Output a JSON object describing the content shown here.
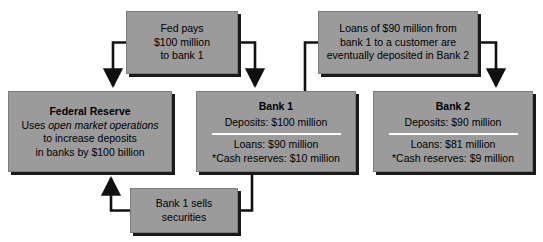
{
  "diagram": {
    "fill_color": "#9b9b9b",
    "shadow_color": "#1a1a1a",
    "rule_color": "#ffffff",
    "connector_color": "#101010",
    "nodes": {
      "fed_pays": {
        "lines": [
          "Fed pays",
          "$100 million",
          "to bank 1"
        ]
      },
      "loans_note": {
        "lines": [
          "Loans of $90 million from",
          "bank 1 to a customer are",
          "eventually deposited in Bank 2"
        ]
      },
      "federal_reserve": {
        "title": "Federal Reserve",
        "line1_prefix": "Uses ",
        "line1_italic": "open market operations",
        "line2": "to increase deposits",
        "line3": "in banks by $100 billion"
      },
      "bank_1": {
        "title": "Bank 1",
        "deposits": "Deposits: $100 million",
        "loans": "Loans: $90 million",
        "cash_reserves": "*Cash reserves: $10 million"
      },
      "bank_2": {
        "title": "Bank 2",
        "deposits": "Deposits: $90 million",
        "loans": "Loans: $81 million",
        "cash_reserves": "*Cash reserves: $9 million"
      },
      "sells_securities": {
        "lines": [
          "Bank 1 sells",
          "securities"
        ]
      }
    },
    "connectors": [
      {
        "name": "fed-pays-to-federal-reserve",
        "arrowhead": "down"
      },
      {
        "name": "fed-pays-to-bank-1",
        "arrowhead": "down"
      },
      {
        "name": "loans-note-to-bank-1",
        "arrowhead": "none"
      },
      {
        "name": "loans-note-to-bank-2",
        "arrowhead": "down"
      },
      {
        "name": "bank-1-to-sells-securities",
        "arrowhead": "none"
      },
      {
        "name": "sells-securities-to-federal-reserve",
        "arrowhead": "up"
      }
    ]
  }
}
